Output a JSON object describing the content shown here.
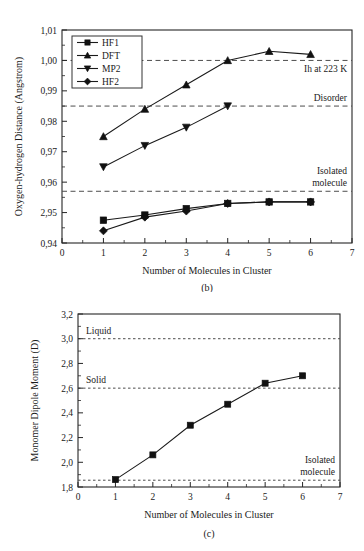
{
  "figure": {
    "background": "#ffffff",
    "ink": "#1a1a1a"
  },
  "chart_data": [
    {
      "id": "panel_b",
      "type": "line",
      "caption": "(b)",
      "title": "",
      "xlabel": "Number of Molecules in Cluster",
      "ylabel": "Oxygen-hydrogen Distance (Angstrom)",
      "xlim": [
        0,
        7
      ],
      "ylim": [
        0.94,
        1.01
      ],
      "grid": false,
      "legend_position": "top-left",
      "xticks": [
        0,
        1,
        2,
        3,
        4,
        5,
        6,
        7
      ],
      "xticklabels": [
        "0",
        "1",
        "2",
        "3",
        "4",
        "5",
        "6",
        "7"
      ],
      "yticks": [
        0.94,
        0.95,
        0.96,
        0.97,
        0.98,
        0.99,
        1.0,
        1.01
      ],
      "yticklabels": [
        "0,94",
        "2,95",
        "0,96",
        "0,97",
        "0,98",
        "0,99",
        "1,00",
        "1,01"
      ],
      "series": [
        {
          "name": "HF1",
          "marker": "square",
          "x": [
            1,
            2,
            3,
            4,
            5,
            6
          ],
          "values": [
            0.9475,
            0.9492,
            0.9513,
            0.953,
            0.9535,
            0.9535
          ]
        },
        {
          "name": "DFT",
          "marker": "triangle-up",
          "x": [
            1,
            2,
            3,
            4,
            5,
            6
          ],
          "values": [
            0.975,
            0.984,
            0.992,
            1.0,
            1.003,
            1.002
          ]
        },
        {
          "name": "MP2",
          "marker": "triangle-down",
          "x": [
            1,
            2,
            3,
            4
          ],
          "values": [
            0.965,
            0.972,
            0.978,
            0.985
          ]
        },
        {
          "name": "HF2",
          "marker": "diamond",
          "x": [
            1,
            2,
            3,
            4,
            5,
            6
          ],
          "values": [
            0.944,
            0.9485,
            0.9505,
            0.953,
            0.9535,
            0.9535
          ]
        }
      ],
      "reference_lines": [
        {
          "label": "Ih at 223 K",
          "value": 1.0,
          "label_position": "below-right"
        },
        {
          "label": "Disorder",
          "value": 0.985,
          "label_position": "above-right"
        },
        {
          "label": "Isolated\nmolecule",
          "value": 0.957,
          "label_position": "above-right"
        }
      ]
    },
    {
      "id": "panel_c",
      "type": "line",
      "caption": "(c)",
      "title": "",
      "xlabel": "Number of Molecules in Cluster",
      "ylabel": "Monomer Dipole Moment (D)",
      "xlim": [
        0,
        7
      ],
      "ylim": [
        1.8,
        3.2
      ],
      "grid": false,
      "legend_position": "none",
      "xticks": [
        0,
        1,
        2,
        3,
        4,
        5,
        6,
        7
      ],
      "xticklabels": [
        "0",
        "1",
        "2",
        "3",
        "4",
        "5",
        "6",
        "7"
      ],
      "yticks": [
        1.8,
        2.0,
        2.2,
        2.4,
        2.6,
        2.8,
        3.0,
        3.2
      ],
      "yticklabels": [
        "1,8",
        "2,0",
        "2,2",
        "2,4",
        "2,6",
        "2,8",
        "3,0",
        "3,2"
      ],
      "series": [
        {
          "name": "Monomer dipole moment",
          "marker": "square",
          "x": [
            1,
            2,
            3,
            4,
            5,
            6
          ],
          "values": [
            1.86,
            2.06,
            2.3,
            2.47,
            2.64,
            2.7
          ]
        }
      ],
      "reference_lines": [
        {
          "label": "Liquid",
          "value": 3.0,
          "label_position": "above-left"
        },
        {
          "label": "Solid",
          "value": 2.6,
          "label_position": "above-left"
        },
        {
          "label": "Isolated\nmolecule",
          "value": 1.855,
          "label_position": "above-right"
        }
      ]
    }
  ]
}
